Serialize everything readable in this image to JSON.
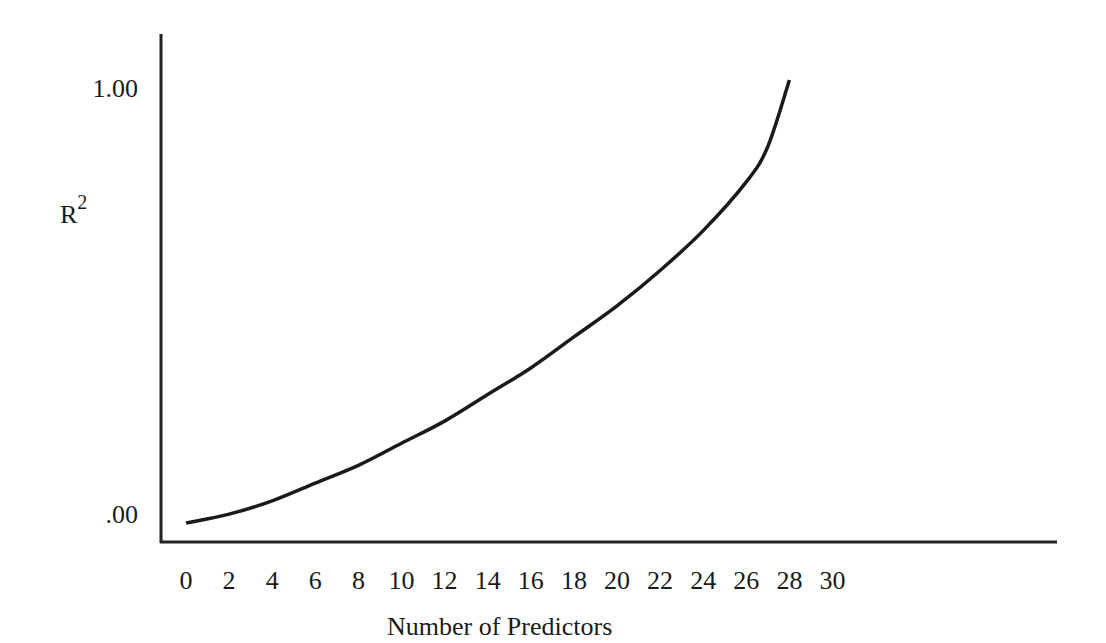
{
  "chart_data": {
    "type": "line",
    "title": "",
    "xlabel": "Number of Predictors",
    "ylabel": "R²",
    "ylabel_base": "R",
    "ylabel_sup": "2",
    "x_ticks": [
      "0",
      "2",
      "4",
      "6",
      "8",
      "10",
      "12",
      "14",
      "16",
      "18",
      "20",
      "22",
      "24",
      "26",
      "28",
      "30"
    ],
    "y_ticks": [
      ".00",
      "1.00"
    ],
    "xlim": [
      0,
      30
    ],
    "ylim": [
      0,
      1
    ],
    "grid": false,
    "legend": null,
    "series": [
      {
        "name": "R² vs. number of predictors",
        "x": [
          0,
          2,
          4,
          6,
          8,
          10,
          12,
          14,
          16,
          18,
          20,
          22,
          24,
          26,
          27,
          28
        ],
        "y": [
          0.0,
          0.02,
          0.05,
          0.09,
          0.13,
          0.18,
          0.23,
          0.29,
          0.35,
          0.42,
          0.49,
          0.57,
          0.66,
          0.77,
          0.85,
          1.0
        ]
      }
    ]
  }
}
